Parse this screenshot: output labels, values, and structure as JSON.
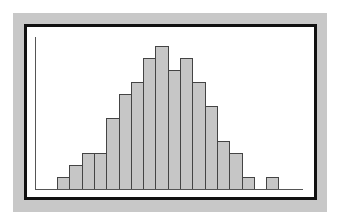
{
  "chart_data": {
    "type": "bar",
    "subtype": "histogram",
    "title": "",
    "xlabel": "",
    "ylabel": "",
    "categories": [
      "1",
      "2",
      "3",
      "4",
      "5",
      "6",
      "7",
      "8",
      "9",
      "10",
      "11",
      "12",
      "13",
      "14",
      "15",
      "16",
      "17",
      "18"
    ],
    "values": [
      1,
      2,
      3,
      3,
      6,
      8,
      9,
      11,
      12,
      10,
      11,
      9,
      7,
      4,
      3,
      1,
      0,
      1
    ],
    "ylim": [
      0,
      12.5
    ],
    "grid": false,
    "legend": null,
    "tick_labels_visible": false
  },
  "colors": {
    "background": "#c8c8c8",
    "frame": "#111111",
    "plot_area": "#ffffff",
    "bar_fill": "#c6c6c6",
    "bar_edge": "#444444",
    "axis": "#555555"
  },
  "layout": {
    "bar_start_x": 57,
    "bar_width": 12.3,
    "baseline_y": 189,
    "unit_px": 11.9
  }
}
